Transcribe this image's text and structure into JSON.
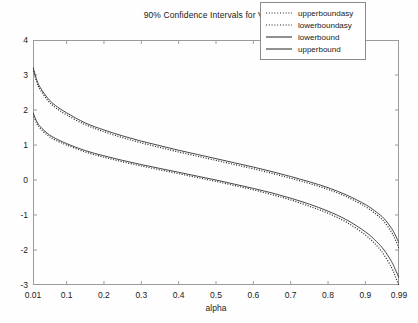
{
  "chart_data": {
    "type": "line",
    "title": "90% Confidence Intervals for VaR",
    "xlabel": "alpha",
    "ylabel": "",
    "xlim": [
      0.01,
      0.99
    ],
    "ylim": [
      -3,
      4
    ],
    "grid": false,
    "legend_position": "top-right",
    "xticks": [
      "0.01",
      "0.1",
      "0.2",
      "0.3",
      "0.4",
      "0.5",
      "0.6",
      "0.7",
      "0.8",
      "0.9",
      "0.99"
    ],
    "xtick_values": [
      0.01,
      0.1,
      0.2,
      0.3,
      0.4,
      0.5,
      0.6,
      0.7,
      0.8,
      0.9,
      0.99
    ],
    "yticks": [
      "4",
      "3",
      "2",
      "1",
      "0",
      "-1",
      "-2",
      "-3"
    ],
    "ytick_values": [
      4,
      3,
      2,
      1,
      0,
      -1,
      -2,
      -3
    ],
    "x": [
      0.01,
      0.02,
      0.03,
      0.05,
      0.07,
      0.1,
      0.15,
      0.2,
      0.25,
      0.3,
      0.35,
      0.4,
      0.45,
      0.5,
      0.55,
      0.6,
      0.65,
      0.7,
      0.75,
      0.8,
      0.85,
      0.9,
      0.93,
      0.95,
      0.97,
      0.98,
      0.99
    ],
    "series": [
      {
        "name": "upperboundasy",
        "style": "dotted",
        "color": "#222222",
        "values": [
          3.18,
          2.8,
          2.57,
          2.27,
          2.07,
          1.86,
          1.58,
          1.38,
          1.21,
          1.06,
          0.93,
          0.8,
          0.68,
          0.56,
          0.44,
          0.32,
          0.19,
          0.05,
          -0.1,
          -0.27,
          -0.48,
          -0.76,
          -0.99,
          -1.19,
          -1.49,
          -1.7,
          -1.95
        ]
      },
      {
        "name": "lowerboundasy",
        "style": "dotted",
        "color": "#222222",
        "values": [
          1.88,
          1.62,
          1.47,
          1.27,
          1.14,
          1.0,
          0.8,
          0.65,
          0.52,
          0.4,
          0.29,
          0.18,
          0.07,
          -0.04,
          -0.16,
          -0.28,
          -0.42,
          -0.57,
          -0.75,
          -0.95,
          -1.21,
          -1.57,
          -1.87,
          -2.14,
          -2.5,
          -2.75,
          -3.02
        ]
      },
      {
        "name": "lowerbound",
        "style": "solid",
        "color": "#333333",
        "values": [
          1.93,
          1.67,
          1.52,
          1.32,
          1.19,
          1.04,
          0.84,
          0.69,
          0.56,
          0.44,
          0.33,
          0.22,
          0.11,
          0.0,
          -0.12,
          -0.24,
          -0.37,
          -0.52,
          -0.69,
          -0.89,
          -1.14,
          -1.48,
          -1.76,
          -2.0,
          -2.33,
          -2.55,
          -2.8
        ]
      },
      {
        "name": "upperbound",
        "style": "solid",
        "color": "#333333",
        "values": [
          3.23,
          2.86,
          2.63,
          2.33,
          2.13,
          1.92,
          1.63,
          1.43,
          1.26,
          1.11,
          0.98,
          0.85,
          0.73,
          0.61,
          0.49,
          0.37,
          0.24,
          0.1,
          -0.05,
          -0.22,
          -0.43,
          -0.7,
          -0.92,
          -1.1,
          -1.38,
          -1.57,
          -1.8
        ]
      }
    ]
  },
  "legend": {
    "items": [
      {
        "label": "upperboundasy",
        "style": "dotted"
      },
      {
        "label": "lowerboundasy",
        "style": "dotted"
      },
      {
        "label": "lowerbound",
        "style": "solid"
      },
      {
        "label": "upperbound",
        "style": "solid"
      }
    ]
  }
}
